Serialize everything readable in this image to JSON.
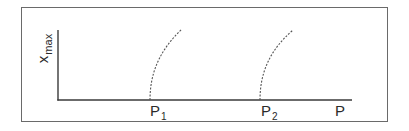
{
  "diagram": {
    "y_axis": {
      "label_base": "x",
      "label_sub": "max"
    },
    "x_axis": {
      "label": "P"
    },
    "markers": [
      {
        "label_base": "P",
        "label_sub": "1"
      },
      {
        "label_base": "P",
        "label_sub": "2"
      }
    ],
    "curves": [
      {
        "style": "dashed",
        "start_marker": "P1"
      },
      {
        "style": "dashed",
        "start_marker": "P2"
      }
    ],
    "colors": {
      "line": "#3a3a3a",
      "frame": "#6a6a6a",
      "curve": "#555555"
    }
  }
}
